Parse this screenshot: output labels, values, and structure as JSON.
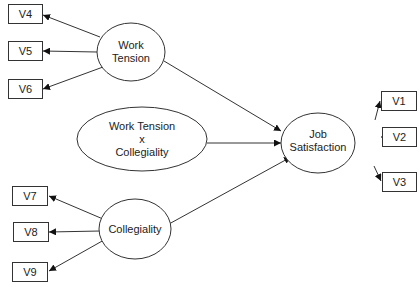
{
  "diagram": {
    "type": "structural-equation-path-diagram",
    "latent_variables": [
      {
        "id": "work_tension",
        "label_line1": "Work",
        "label_line2": "Tension"
      },
      {
        "id": "interaction",
        "label_line1": "Work Tension",
        "label_line2": "x",
        "label_line3": "Collegiality"
      },
      {
        "id": "collegiality",
        "label_line1": "Collegiality"
      },
      {
        "id": "job_satisfaction",
        "label_line1": "Job",
        "label_line2": "Satisfaction"
      }
    ],
    "observed_variables": [
      {
        "id": "V1",
        "label": "V1"
      },
      {
        "id": "V2",
        "label": "V2"
      },
      {
        "id": "V3",
        "label": "V3"
      },
      {
        "id": "V4",
        "label": "V4"
      },
      {
        "id": "V5",
        "label": "V5"
      },
      {
        "id": "V6",
        "label": "V6"
      },
      {
        "id": "V7",
        "label": "V7"
      },
      {
        "id": "V8",
        "label": "V8"
      },
      {
        "id": "V9",
        "label": "V9"
      }
    ],
    "edges": [
      {
        "from": "work_tension",
        "to": "V4"
      },
      {
        "from": "work_tension",
        "to": "V5"
      },
      {
        "from": "work_tension",
        "to": "V6"
      },
      {
        "from": "collegiality",
        "to": "V7"
      },
      {
        "from": "collegiality",
        "to": "V8"
      },
      {
        "from": "collegiality",
        "to": "V9"
      },
      {
        "from": "job_satisfaction",
        "to": "V1"
      },
      {
        "from": "job_satisfaction",
        "to": "V2"
      },
      {
        "from": "job_satisfaction",
        "to": "V3"
      },
      {
        "from": "work_tension",
        "to": "job_satisfaction"
      },
      {
        "from": "interaction",
        "to": "job_satisfaction"
      },
      {
        "from": "collegiality",
        "to": "job_satisfaction"
      }
    ],
    "colors": {
      "stroke": "#333333",
      "text": "#222222",
      "background": "#ffffff"
    }
  }
}
